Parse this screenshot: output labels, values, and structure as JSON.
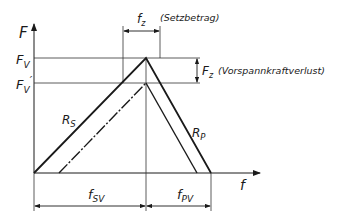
{
  "diagram": {
    "axes": {
      "y_label": "F",
      "x_label": "f"
    },
    "levels": {
      "fv_main": "F",
      "fv_main_sub": "V",
      "fv_prime": "F",
      "fv_prime_sub": "V",
      "fv_prime_mark": "′"
    },
    "curves": {
      "rs_main": "R",
      "rs_sub": "S",
      "rp_main": "R",
      "rp_sub": "P"
    },
    "dimensions": {
      "fz_main": "f",
      "fz_sub": "z",
      "fz_note": "(Setzbetrag)",
      "Fz_main": "F",
      "Fz_sub": "z",
      "Fz_note": "(Vorspannkraftverlust)",
      "fsv_main": "f",
      "fsv_sub": "SV",
      "fpv_main": "f",
      "fpv_sub": "PV"
    }
  }
}
